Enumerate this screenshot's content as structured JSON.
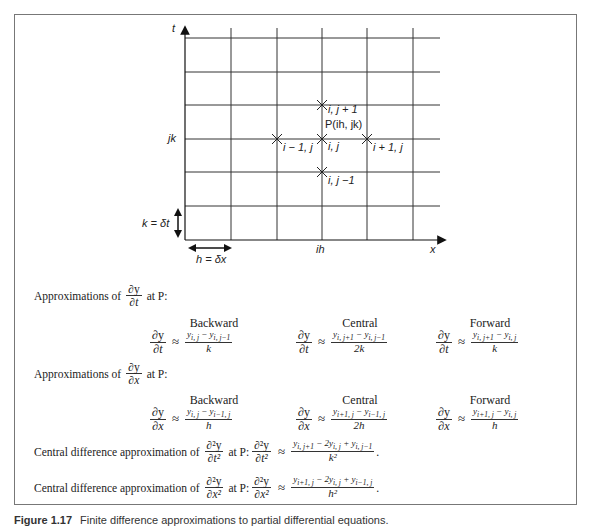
{
  "diagram": {
    "axis_t": "t",
    "axis_x": "x",
    "row_label": "jk",
    "col_label": "ih",
    "k_label": "k = δt",
    "h_label": "h = δx",
    "point_label": "P(ih, jk)",
    "nodes": {
      "center": "i, j",
      "up": "i, j + 1",
      "down": "i, j −1",
      "left": "i − 1, j",
      "right": "i + 1, j"
    }
  },
  "dt_section": {
    "intro_prefix": "Approximations of",
    "intro_suffix": "at P:",
    "d_num": "∂y",
    "d_den": "∂t",
    "backward": {
      "label": "Backward",
      "num": "y_{i,j} − y_{i,j−1}",
      "num_a": "y",
      "num_a_sub": "i, j",
      "num_b": "y",
      "num_b_sub": "i, j−1",
      "den": "k"
    },
    "central": {
      "label": "Central",
      "num_a": "y",
      "num_a_sub": "i, j+1",
      "num_b": "y",
      "num_b_sub": "i, j−1",
      "den": "2k"
    },
    "forward": {
      "label": "Forward",
      "num_a": "y",
      "num_a_sub": "i, j+1",
      "num_b": "y",
      "num_b_sub": "i, j",
      "den": "k"
    }
  },
  "dx_section": {
    "intro_prefix": "Approximations of",
    "intro_suffix": "at P:",
    "d_num": "∂y",
    "d_den": "∂x",
    "backward": {
      "label": "Backward",
      "num_a": "y",
      "num_a_sub": "i, j",
      "num_b": "y",
      "num_b_sub": "i−1, j",
      "den": "h"
    },
    "central": {
      "label": "Central",
      "num_a": "y",
      "num_a_sub": "i+1, j",
      "num_b": "y",
      "num_b_sub": "i−1, j",
      "den": "2h"
    },
    "forward": {
      "label": "Forward",
      "num_a": "y",
      "num_a_sub": "i+1, j",
      "num_b": "y",
      "num_b_sub": "i, j",
      "den": "h"
    }
  },
  "second_t": {
    "prefix": "Central difference approximation of",
    "d_num": "∂²y",
    "d_den": "∂t²",
    "suffix": "at P:",
    "num": "y_{i,j+1} − 2y_{i,j} + y_{i,j−1}",
    "n1": "y",
    "n1s": "i, j+1",
    "n2": "− 2y",
    "n2s": "i, j",
    "n3": "+ y",
    "n3s": "i, j−1",
    "den": "k²"
  },
  "second_x": {
    "prefix": "Central difference approximation of",
    "d_num": "∂²y",
    "d_den": "∂x²",
    "suffix": "at P:",
    "n1": "y",
    "n1s": "i+1, j",
    "n2": "− 2y",
    "n2s": "i, j",
    "n3": "+ y",
    "n3s": "i−1, j",
    "den": "h²"
  },
  "symbols": {
    "approx": "≈",
    "minus": "−",
    "period": "."
  },
  "caption": {
    "label": "Figure 1.17",
    "text": "Finite difference approximations to partial differential equations."
  }
}
